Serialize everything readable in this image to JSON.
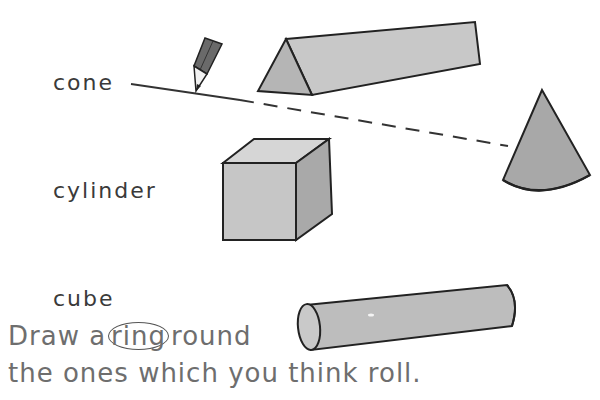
{
  "labels": {
    "cone": "cone",
    "cylinder": "cylinder",
    "cube": "cube"
  },
  "instruction": {
    "line1_before": "Draw a",
    "line1_ring_word": "ring",
    "line1_after": "round",
    "line2": "the ones which you think roll."
  },
  "shapes": [
    "triangular-prism",
    "cube",
    "cone",
    "cylinder",
    "pencil"
  ],
  "colors": {
    "ink": "#333333",
    "shape_fill": "#bdbdbd",
    "shape_fill_light": "#d2d2d2",
    "shape_fill_dark": "#a8a8a8",
    "instruction_text": "#6e6e6e"
  }
}
